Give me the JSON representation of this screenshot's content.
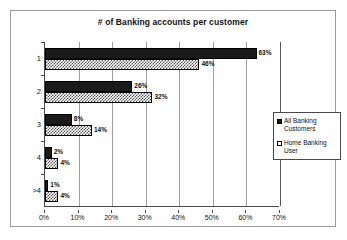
{
  "chart_data": {
    "type": "bar",
    "orientation": "horizontal",
    "title": "# of Banking accounts per customer",
    "xlabel": "",
    "ylabel": "",
    "categories": [
      "1",
      "2",
      "3",
      "4",
      ">4"
    ],
    "xticks": [
      "0%",
      "10%",
      "20%",
      "30%",
      "40%",
      "50%",
      "60%",
      "70%"
    ],
    "xtick_values": [
      0,
      10,
      20,
      30,
      40,
      50,
      60,
      70
    ],
    "xlim": [
      0,
      70
    ],
    "grid": true,
    "legend_position": "right",
    "series": [
      {
        "name": "All Banking Customers",
        "fill": "solid-black",
        "values": [
          63,
          26,
          8,
          2,
          1
        ],
        "labels": [
          "63%",
          "26%",
          "8%",
          "2%",
          "1%"
        ]
      },
      {
        "name": "Home Banking User",
        "fill": "checkered",
        "values": [
          46,
          32,
          14,
          4,
          4
        ],
        "labels": [
          "46%",
          "32%",
          "14%",
          "4%",
          "4%"
        ]
      }
    ]
  },
  "colors": {
    "series_dark": "#1a1a1a",
    "series_light": "#ffffff",
    "axis": "#4a4a4a",
    "grid": "#9f9f9f",
    "frame": "#9a9a9a",
    "text": "#111111",
    "background": "#ffffff"
  }
}
